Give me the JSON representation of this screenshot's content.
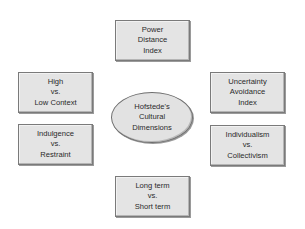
{
  "diagram": {
    "center": {
      "lines": [
        "Hofstede's",
        "Cultural",
        "Dimensions"
      ]
    },
    "nodes": [
      {
        "id": "power-distance",
        "position": "top",
        "lines": [
          "Power",
          "Distance",
          "Index"
        ]
      },
      {
        "id": "high-low-context",
        "position": "left-top",
        "lines": [
          "High",
          "vs.",
          "Low Context"
        ]
      },
      {
        "id": "indulgence-restraint",
        "position": "left-bottom",
        "lines": [
          "Indulgence",
          "vs.",
          "Restraint"
        ]
      },
      {
        "id": "uncertainty-avoidance",
        "position": "right-top",
        "lines": [
          "Uncertainty",
          "Avoidance",
          "Index"
        ]
      },
      {
        "id": "individualism-collectivism",
        "position": "right-bottom",
        "lines": [
          "Individualism",
          "vs.",
          "Collectivism"
        ]
      },
      {
        "id": "long-short-term",
        "position": "bottom",
        "lines": [
          "Long term",
          "vs.",
          "Short term"
        ]
      }
    ],
    "colors": {
      "box_fill": "#e4e4e4",
      "box_border": "#7a7a7a",
      "text": "#2a2a2a",
      "background": "#ffffff"
    }
  }
}
